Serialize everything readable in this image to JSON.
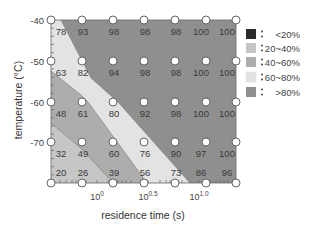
{
  "chart_data": {
    "type": "heatmap",
    "title": "",
    "xlabel": "residence time (s)",
    "ylabel": "temperature (°C)",
    "x_scale": "log10",
    "x_tick_labels": [
      {
        "base": "10",
        "exp": "0",
        "pos": 97
      },
      {
        "base": "10",
        "exp": "0.5",
        "pos": 148
      },
      {
        "base": "10",
        "exp": "1.0",
        "pos": 199
      }
    ],
    "y_tick_labels": [
      "-40",
      "-50",
      "-60",
      "-70"
    ],
    "grid": false,
    "legend_position": "right",
    "legend": [
      {
        "label": "<20%",
        "color": "#2b2b2b"
      },
      {
        "label": "20~40%",
        "color": "#c6c6c6"
      },
      {
        "label": "40~60%",
        "color": "#adadad"
      },
      {
        "label": "60~80%",
        "color": "#e3e3e3"
      },
      {
        "label": ">80%",
        "color": "#8f8f8f"
      }
    ],
    "rows": [
      {
        "temperature": -40,
        "values": [
          78,
          93,
          98,
          98,
          98,
          100,
          100
        ]
      },
      {
        "temperature": -50,
        "values": [
          63,
          82,
          94,
          98,
          98,
          100,
          100
        ]
      },
      {
        "temperature": -60,
        "values": [
          48,
          61,
          80,
          92,
          98,
          100,
          100
        ]
      },
      {
        "temperature": -70,
        "values": [
          32,
          49,
          60,
          76,
          90,
          97,
          100
        ]
      },
      {
        "temperature": -80,
        "values": [
          20,
          26,
          39,
          56,
          73,
          86,
          96
        ]
      }
    ],
    "unit": "%"
  }
}
